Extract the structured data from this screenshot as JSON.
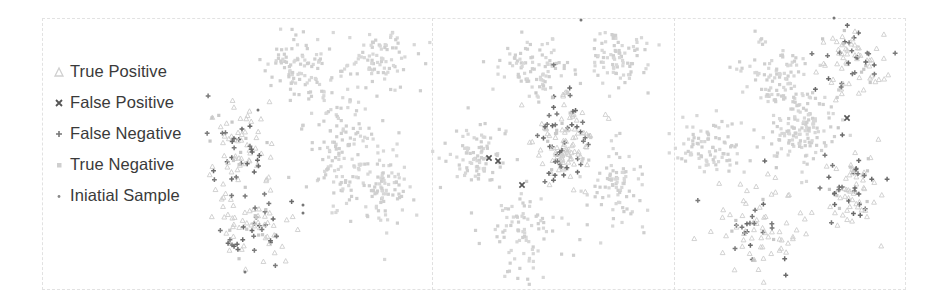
{
  "chart_data": {
    "type": "scatter",
    "title": "",
    "xlabel": "",
    "ylabel": "",
    "grid": false,
    "legend_position": "left",
    "legend": [
      {
        "label": "True Positive",
        "marker": "triangle",
        "color": "#d0d0d0"
      },
      {
        "label": "False Positive",
        "marker": "x",
        "color": "#555555"
      },
      {
        "label": "False Negative",
        "marker": "plus",
        "color": "#666666"
      },
      {
        "label": "True Negative",
        "marker": "square",
        "color": "#cccccc"
      },
      {
        "label": "Iniatial Sample",
        "marker": "dot",
        "color": "#888888"
      }
    ],
    "panels": [
      {
        "name": "panel-1",
        "x0": 200,
        "x1": 432,
        "clusters": [
          {
            "id": "top-left",
            "cx": 297,
            "cy": 68,
            "sx": 18,
            "sy": 16,
            "n": 90,
            "positive": false
          },
          {
            "id": "top-right",
            "cx": 378,
            "cy": 60,
            "sx": 18,
            "sy": 16,
            "n": 85,
            "positive": false
          },
          {
            "id": "left",
            "cx": 238,
            "cy": 148,
            "sx": 14,
            "sy": 18,
            "n": 85,
            "positive": true
          },
          {
            "id": "center",
            "cx": 340,
            "cy": 145,
            "sx": 18,
            "sy": 32,
            "n": 140,
            "positive": false
          },
          {
            "id": "right",
            "cx": 381,
            "cy": 190,
            "sx": 14,
            "sy": 22,
            "n": 85,
            "positive": false
          },
          {
            "id": "bottom-left",
            "cx": 250,
            "cy": 228,
            "sx": 20,
            "sy": 18,
            "n": 90,
            "positive": true
          }
        ],
        "false_positives": [],
        "initial_samples": [
          [
            258,
            110
          ],
          [
            303,
            205
          ],
          [
            303,
            213
          ],
          [
            245,
            272
          ]
        ]
      },
      {
        "name": "panel-2",
        "x0": 432,
        "x1": 674,
        "clusters": [
          {
            "id": "top-left",
            "cx": 533,
            "cy": 68,
            "sx": 18,
            "sy": 16,
            "n": 90,
            "positive": false
          },
          {
            "id": "top-right",
            "cx": 618,
            "cy": 60,
            "sx": 18,
            "sy": 16,
            "n": 85,
            "positive": false
          },
          {
            "id": "left",
            "cx": 475,
            "cy": 155,
            "sx": 15,
            "sy": 15,
            "n": 85,
            "positive": false
          },
          {
            "id": "center",
            "cx": 567,
            "cy": 140,
            "sx": 16,
            "sy": 20,
            "n": 140,
            "positive": true
          },
          {
            "id": "right",
            "cx": 617,
            "cy": 190,
            "sx": 14,
            "sy": 22,
            "n": 85,
            "positive": false
          },
          {
            "id": "bottom-left",
            "cx": 525,
            "cy": 235,
            "sx": 22,
            "sy": 24,
            "n": 90,
            "positive": false
          }
        ],
        "false_positives": [
          [
            489,
            158
          ],
          [
            498,
            161
          ],
          [
            522,
            185
          ]
        ],
        "initial_samples": [
          [
            581,
            20
          ]
        ]
      },
      {
        "name": "panel-3",
        "x0": 674,
        "x1": 906,
        "clusters": [
          {
            "id": "top-left",
            "cx": 773,
            "cy": 72,
            "sx": 18,
            "sy": 16,
            "n": 90,
            "positive": false
          },
          {
            "id": "top-right",
            "cx": 857,
            "cy": 60,
            "sx": 17,
            "sy": 16,
            "n": 85,
            "positive": true
          },
          {
            "id": "left",
            "cx": 710,
            "cy": 150,
            "sx": 16,
            "sy": 15,
            "n": 85,
            "positive": false
          },
          {
            "id": "center",
            "cx": 805,
            "cy": 130,
            "sx": 18,
            "sy": 20,
            "n": 140,
            "positive": false
          },
          {
            "id": "right",
            "cx": 853,
            "cy": 188,
            "sx": 14,
            "sy": 20,
            "n": 85,
            "positive": true
          },
          {
            "id": "bottom-left",
            "cx": 762,
            "cy": 228,
            "sx": 24,
            "sy": 24,
            "n": 90,
            "positive": true
          }
        ],
        "false_positives": [
          [
            847,
            118
          ]
        ],
        "initial_samples": [
          [
            834,
            18
          ]
        ]
      }
    ]
  }
}
